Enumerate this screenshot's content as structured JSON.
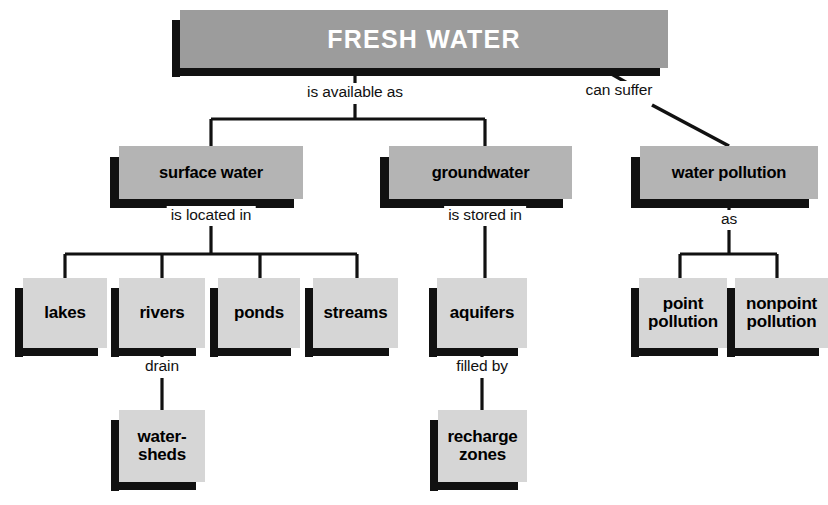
{
  "diagram": {
    "title": "FRESH WATER",
    "type": "concept-map",
    "colors": {
      "title_fill": "#9c9c9c",
      "mid_fill": "#b4b4b4",
      "leaf_fill": "#d6d6d6",
      "shadow": "#111111",
      "background": "#ffffff",
      "title_text": "#ffffff",
      "node_text": "#000000"
    },
    "nodes": {
      "root": "FRESH WATER",
      "surface_water": "surface water",
      "groundwater": "groundwater",
      "water_pollution": "water pollution",
      "lakes": "lakes",
      "rivers": "rivers",
      "ponds": "ponds",
      "streams": "streams",
      "aquifers": "aquifers",
      "point_pollution_line1": "point",
      "point_pollution_line2": "pollution",
      "nonpoint_pollution_line1": "nonpoint",
      "nonpoint_pollution_line2": "pollution",
      "watersheds_line1": "water-",
      "watersheds_line2": "sheds",
      "recharge_zones_line1": "recharge",
      "recharge_zones_line2": "zones"
    },
    "edge_labels": {
      "is_available_as": "is available as",
      "can_suffer": "can suffer",
      "is_located_in": "is located in",
      "is_stored_in": "is stored in",
      "as": "as",
      "drain": "drain",
      "filled_by": "filled by"
    }
  }
}
